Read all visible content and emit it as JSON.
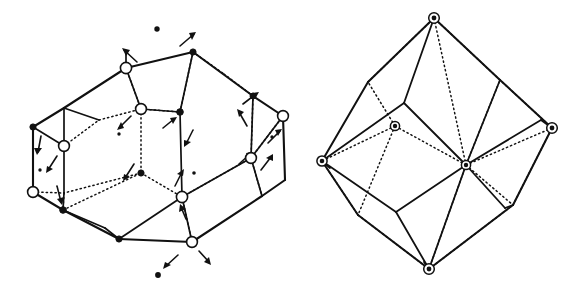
{
  "figure": {
    "background_color": "#ffffff",
    "line_color": "#111111",
    "width": 575,
    "height": 294,
    "panels": [
      {
        "id": "left-panel",
        "name": "distorted-polyhedron-with-displacement-arrows",
        "description": "Polyhedron drawn with solid visible edges and dotted hidden edges; vertices marked by open circles and filled dots; small arrows indicate atomic displacement directions.",
        "marker_legend": {
          "open_circle": "open-circle-vertex",
          "filled_dot": "filled-dot-vertex",
          "arrow": "displacement-arrow"
        },
        "open_circle_vertices": [
          [
            126,
            68
          ],
          [
            141,
            109
          ],
          [
            64,
            146
          ],
          [
            33,
            192
          ],
          [
            283,
            116
          ],
          [
            251,
            158
          ],
          [
            182,
            197
          ],
          [
            192,
            242
          ]
        ],
        "filled_dot_vertices": [
          [
            193,
            52
          ],
          [
            33,
            127
          ],
          [
            180,
            112
          ],
          [
            141,
            173
          ],
          [
            253,
            96
          ],
          [
            63,
            210
          ],
          [
            119,
            239
          ]
        ],
        "free_dots": [
          [
            157,
            29
          ],
          [
            158,
            275
          ],
          [
            119,
            134
          ],
          [
            145,
            172
          ],
          [
            40,
            170
          ],
          [
            194,
            173
          ],
          [
            272,
            137
          ]
        ],
        "arrows": [
          [
            [
              137,
              62
            ],
            [
              122,
              48
            ]
          ],
          [
            [
              180,
              46
            ],
            [
              195,
              32
            ]
          ],
          [
            [
              131,
              116
            ],
            [
              118,
              130
            ]
          ],
          [
            [
              41,
              136
            ],
            [
              37,
              154
            ]
          ],
          [
            [
              55,
              155
            ],
            [
              46,
              172
            ]
          ],
          [
            [
              57,
              185
            ],
            [
              62,
              204
            ]
          ],
          [
            [
              134,
              164
            ],
            [
              124,
              180
            ]
          ],
          [
            [
              243,
              104
            ],
            [
              258,
              92
            ]
          ],
          [
            [
              247,
              126
            ],
            [
              238,
              110
            ]
          ],
          [
            [
              268,
              143
            ],
            [
              281,
              129
            ]
          ],
          [
            [
              261,
              170
            ],
            [
              272,
              155
            ]
          ],
          [
            [
              239,
              164
            ],
            [
              252,
              152
            ]
          ],
          [
            [
              175,
              186
            ],
            [
              183,
              170
            ]
          ],
          [
            [
              186,
              219
            ],
            [
              180,
              205
            ]
          ],
          [
            [
              178,
              255
            ],
            [
              164,
              268
            ]
          ],
          [
            [
              199,
              251
            ],
            [
              210,
              264
            ]
          ],
          [
            [
              163,
              128
            ],
            [
              175,
              118
            ]
          ],
          [
            [
              193,
              130
            ],
            [
              185,
              146
            ]
          ]
        ]
      },
      {
        "id": "right-panel",
        "name": "rhombic-dodecahedron-with-ringed-vertices",
        "description": "Rhombic polyhedron drawn with solid visible edges and dotted hidden edges; six vertices marked by circled dots (ring markers).",
        "marker_legend": {
          "ring_dot": "circled-dot-vertex"
        },
        "ring_vertices": [
          [
            434,
            18
          ],
          [
            322,
            161
          ],
          [
            552,
            128
          ],
          [
            429,
            269
          ],
          [
            395,
            126
          ],
          [
            466,
            165
          ]
        ]
      }
    ]
  }
}
